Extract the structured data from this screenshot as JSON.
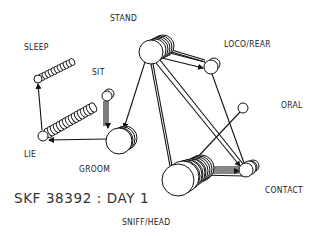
{
  "diagram": {
    "title": "SKF 38392 : DAY 1",
    "type": "behavioral transition diagram",
    "nodes": [
      {
        "id": "stand",
        "label": "STAND"
      },
      {
        "id": "loco_rear",
        "label": "LOCO/REAR"
      },
      {
        "id": "sleep",
        "label": "SLEEP"
      },
      {
        "id": "sit",
        "label": "SIT"
      },
      {
        "id": "oral",
        "label": "ORAL"
      },
      {
        "id": "lie",
        "label": "LIE"
      },
      {
        "id": "groom",
        "label": "GROOM"
      },
      {
        "id": "contact",
        "label": "CONTACT"
      },
      {
        "id": "sniff_head",
        "label": "SNIFF/HEAD"
      }
    ],
    "edges": [
      {
        "from": "stand",
        "to": "loco_rear"
      },
      {
        "from": "loco_rear",
        "to": "stand"
      },
      {
        "from": "stand",
        "to": "groom"
      },
      {
        "from": "stand",
        "to": "sniff_head"
      },
      {
        "from": "stand",
        "to": "contact"
      },
      {
        "from": "loco_rear",
        "to": "contact"
      },
      {
        "from": "sit",
        "to": "groom"
      },
      {
        "from": "groom",
        "to": "lie"
      },
      {
        "from": "lie",
        "to": "sleep"
      },
      {
        "from": "sniff_head",
        "to": "contact"
      },
      {
        "from": "sniff_head",
        "to": "oral"
      },
      {
        "from": "sniff_head",
        "to": "stand"
      }
    ]
  }
}
